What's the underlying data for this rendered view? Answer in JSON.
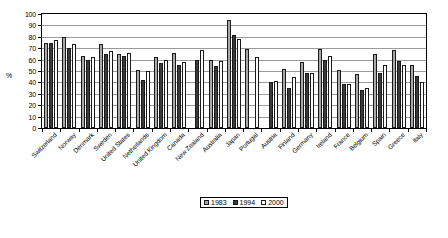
{
  "chart_data": {
    "type": "bar",
    "title": "",
    "xlabel": "",
    "ylabel": "%",
    "ylim": [
      0,
      100
    ],
    "ytick_step": 10,
    "grid": true,
    "legend_position": "bottom",
    "categories": [
      "Switzerland",
      "Norway",
      "Denmark",
      "Sweden",
      "United States",
      "Netherlands",
      "United Kingdom",
      "Canada",
      "New Zealand",
      "Australia",
      "Japan",
      "Portugal",
      "Austria",
      "Finland",
      "Germany",
      "Ireland",
      "France",
      "Belgium",
      "Spain",
      "Greece",
      "Italy"
    ],
    "series": [
      {
        "name": "1983",
        "color": "#a8a8a8",
        "values": [
          74.5,
          80,
          63.5,
          73.5,
          65,
          50.5,
          62.5,
          66,
          null,
          60,
          95,
          69,
          null,
          51.5,
          57.5,
          69,
          50.5,
          47.5,
          65,
          68.5,
          55
        ]
      },
      {
        "name": "1994",
        "color": "#3a3a3a",
        "values": [
          74.5,
          70,
          59.5,
          65,
          63.5,
          42,
          57,
          55,
          60,
          54.5,
          81.5,
          null,
          40.5,
          35,
          48,
          59.5,
          39,
          33.5,
          48.5,
          58.5,
          45.5
        ]
      },
      {
        "name": "2000",
        "color": "#ffffff",
        "values": [
          77,
          73.5,
          62,
          67.5,
          65.5,
          50,
          59.5,
          57.5,
          68,
          59,
          78.5,
          62.5,
          41.5,
          44.5,
          48,
          63.5,
          38.5,
          35,
          55.5,
          55,
          40.5
        ]
      }
    ],
    "ytick_labels": [
      "0",
      "10",
      "20",
      "30",
      "40",
      "50",
      "60",
      "70",
      "80",
      "90",
      "100"
    ]
  },
  "legend": {
    "entries": [
      {
        "label": "1983",
        "swatch": "s1983"
      },
      {
        "label": "1994",
        "swatch": "s1994"
      },
      {
        "label": "2000",
        "swatch": "s2000"
      }
    ]
  }
}
